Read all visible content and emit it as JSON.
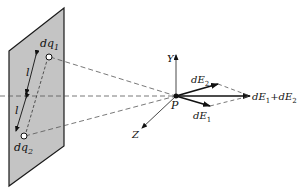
{
  "diagram": {
    "labels": {
      "charge_top": "dq",
      "charge_top_sub": "1",
      "charge_bottom": "dq",
      "charge_bottom_sub": "2",
      "dist_top": "l",
      "dist_bottom": "l",
      "point": "P",
      "axis_y": "Y",
      "axis_z": "Z",
      "field_2": "dE",
      "field_2_sub": "2",
      "field_1": "dE",
      "field_1_sub": "1",
      "resultant_a": "dE",
      "resultant_a_sub": "1",
      "resultant_plus": "+",
      "resultant_b": "dE",
      "resultant_b_sub": "2"
    },
    "colors": {
      "plane_fill": "#c4c4c4",
      "stroke": "#1a1a1a",
      "dashed": "#555555"
    }
  }
}
